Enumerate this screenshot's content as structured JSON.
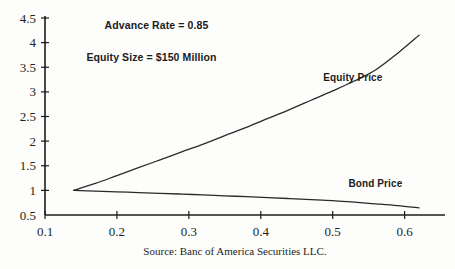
{
  "figure": {
    "background": "#fdfdfb",
    "ink": "#1b1b1b",
    "source_note": "Source: Banc of America Securities LLC."
  },
  "annotations": [
    {
      "name": "advance-rate",
      "text": "Advance Rate = 0.85",
      "x": 0.255,
      "y": 4.27
    },
    {
      "name": "equity-size",
      "text": "Equity Size = $150 Million",
      "x": 0.248,
      "y": 3.62
    }
  ],
  "series_labels": [
    {
      "name": "equity-price-label",
      "text": "Equity Price",
      "x": 0.487,
      "y": 3.22
    },
    {
      "name": "bond-price-label",
      "text": "Bond Price",
      "x": 0.522,
      "y": 1.07
    }
  ],
  "chart_data": {
    "type": "line",
    "title": "",
    "subtitle": "",
    "xlabel": "",
    "ylabel": "",
    "xlim": [
      0.1,
      0.645
    ],
    "ylim": [
      0.5,
      4.5
    ],
    "xticks": [
      "0.1",
      "0.2",
      "0.3",
      "0.4",
      "0.5",
      "0.6"
    ],
    "xtick_values": [
      0.1,
      0.2,
      0.3,
      0.4,
      0.5,
      0.6
    ],
    "yticks": [
      "0.5",
      "1",
      "1.5",
      "2",
      "2.5",
      "3",
      "3.5",
      "4",
      "4.5"
    ],
    "ytick_values": [
      0.5,
      1,
      1.5,
      2,
      2.5,
      3,
      3.5,
      4,
      4.5
    ],
    "grid": false,
    "legend": "inline-labels",
    "series": [
      {
        "name": "Equity Price",
        "x": [
          0.14,
          0.17,
          0.2,
          0.23,
          0.26,
          0.29,
          0.32,
          0.35,
          0.38,
          0.41,
          0.44,
          0.47,
          0.5,
          0.53,
          0.56,
          0.59,
          0.62
        ],
        "values": [
          1.0,
          1.14,
          1.3,
          1.46,
          1.62,
          1.78,
          1.94,
          2.11,
          2.28,
          2.46,
          2.64,
          2.83,
          3.02,
          3.22,
          3.45,
          3.78,
          4.15
        ]
      },
      {
        "name": "Bond Price",
        "x": [
          0.14,
          0.17,
          0.2,
          0.23,
          0.26,
          0.29,
          0.32,
          0.35,
          0.38,
          0.41,
          0.44,
          0.47,
          0.5,
          0.53,
          0.56,
          0.59,
          0.62
        ],
        "values": [
          1.0,
          0.985,
          0.97,
          0.955,
          0.94,
          0.925,
          0.908,
          0.89,
          0.872,
          0.853,
          0.834,
          0.814,
          0.793,
          0.76,
          0.726,
          0.69,
          0.645
        ]
      }
    ]
  }
}
